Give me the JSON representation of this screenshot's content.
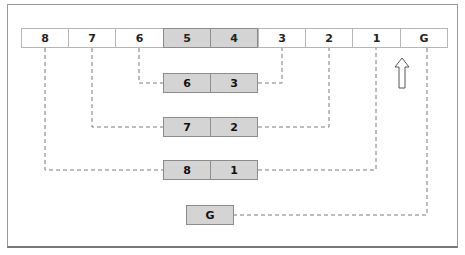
{
  "diagram": {
    "top_row": [
      {
        "label": "8",
        "shaded": false
      },
      {
        "label": "7",
        "shaded": false
      },
      {
        "label": "6",
        "shaded": false
      },
      {
        "label": "5",
        "shaded": true
      },
      {
        "label": "4",
        "shaded": true
      },
      {
        "label": "3",
        "shaded": false
      },
      {
        "label": "2",
        "shaded": false
      },
      {
        "label": "1",
        "shaded": false
      },
      {
        "label": "G",
        "shaded": false
      }
    ],
    "pairs": [
      {
        "left": "6",
        "right": "3"
      },
      {
        "left": "7",
        "right": "2"
      },
      {
        "left": "8",
        "right": "1"
      }
    ],
    "single": {
      "label": "G"
    },
    "arrow": {
      "direction": "up",
      "points_to": "1"
    },
    "colors": {
      "shaded_fill": "#d4d4d4",
      "border": "#8c8c8c",
      "dash": "#7a7a7a"
    }
  }
}
